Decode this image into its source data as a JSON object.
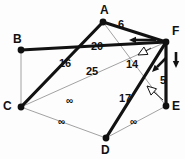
{
  "diagram": {
    "colors": {
      "thick_edge": "#121212",
      "thin_edge": "#8a8a8a",
      "node": "#101010",
      "text": "#111111",
      "background": "#fdfdfd"
    },
    "nodes": [
      {
        "id": "A",
        "label": "A",
        "x": 103,
        "y": 22,
        "label_x": 100,
        "label_y": 4
      },
      {
        "id": "B",
        "label": "B",
        "x": 21,
        "y": 50,
        "label_x": 13,
        "label_y": 33
      },
      {
        "id": "C",
        "label": "C",
        "x": 21,
        "y": 107,
        "label_x": 3,
        "label_y": 100
      },
      {
        "id": "D",
        "label": "D",
        "x": 106,
        "y": 138,
        "label_x": 101,
        "label_y": 144
      },
      {
        "id": "E",
        "label": "E",
        "x": 166,
        "y": 106,
        "label_x": 172,
        "label_y": 100
      },
      {
        "id": "F",
        "label": "F",
        "x": 166,
        "y": 42,
        "label_x": 172,
        "label_y": 25
      }
    ],
    "edges": [
      {
        "from": "A",
        "to": "F",
        "weight": "6",
        "thick": true,
        "label_x": 118,
        "label_y": 19
      },
      {
        "from": "B",
        "to": "F",
        "weight": "20",
        "thick": true,
        "label_x": 91,
        "label_y": 41
      },
      {
        "from": "A",
        "to": "C",
        "weight": "16",
        "thick": true,
        "label_x": 59,
        "label_y": 58
      },
      {
        "from": "C",
        "to": "F",
        "weight": "25",
        "thick": false,
        "label_x": 86,
        "label_y": 66
      },
      {
        "from": "A",
        "to": "E",
        "weight": "14",
        "thick": false,
        "label_x": 126,
        "label_y": 59
      },
      {
        "from": "F",
        "to": "E",
        "weight": "5",
        "thick": true,
        "label_x": 160,
        "label_y": 75
      },
      {
        "from": "D",
        "to": "F",
        "weight": "17",
        "thick": true,
        "label_x": 119,
        "label_y": 93
      },
      {
        "from": "B",
        "to": "C",
        "weight": "∞",
        "thick": false,
        "label_x": 66,
        "label_y": 96
      },
      {
        "from": "C",
        "to": "D",
        "weight": "∞",
        "thick": false,
        "label_x": 58,
        "label_y": 117
      },
      {
        "from": "D",
        "to": "E",
        "weight": "∞",
        "thick": false,
        "label_x": 130,
        "label_y": 117
      }
    ],
    "annotations": [
      {
        "name": "arrow-to-a-f-edge",
        "kind": "solid-arrow",
        "x1": 156,
        "y1": 40,
        "x2": 129,
        "y2": 40
      },
      {
        "name": "arrow-down-f-e",
        "kind": "solid-arrow",
        "x1": 176,
        "y1": 52,
        "x2": 176,
        "y2": 68
      },
      {
        "name": "arrow-to-d-f-edge",
        "kind": "solid-arrow",
        "x1": 166,
        "y1": 58,
        "x2": 152,
        "y2": 72
      },
      {
        "name": "pointer-to-a-e-edge",
        "kind": "hollow-arrow",
        "x1": 151,
        "y1": 48,
        "x2": 138,
        "y2": 55
      },
      {
        "name": "pointer-to-d-f-edge",
        "kind": "hollow-arrow",
        "x1": 163,
        "y1": 100,
        "x2": 147,
        "y2": 86
      }
    ]
  }
}
